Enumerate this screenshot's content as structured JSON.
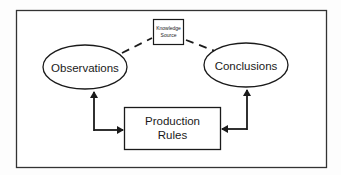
{
  "diagram": {
    "nodes": {
      "knowledge_source": {
        "line1": "Knowledge",
        "line2": "Source"
      },
      "observations": {
        "label": "Observations"
      },
      "conclusions": {
        "label": "Conclusions"
      },
      "production_rules": {
        "line1": "Production",
        "line2": "Rules"
      }
    },
    "edges": [
      {
        "from": "Observations",
        "to": "Knowledge Source",
        "style": "dashed"
      },
      {
        "from": "Knowledge Source",
        "to": "Conclusions",
        "style": "dashed"
      },
      {
        "from": "Observations",
        "to": "Production Rules",
        "style": "bidirectional-arrow"
      },
      {
        "from": "Conclusions",
        "to": "Production Rules",
        "style": "bidirectional-arrow"
      }
    ],
    "colors": {
      "stroke": "#1a1a1a",
      "fill": "#ffffff",
      "background": "#fdfdfd"
    }
  }
}
